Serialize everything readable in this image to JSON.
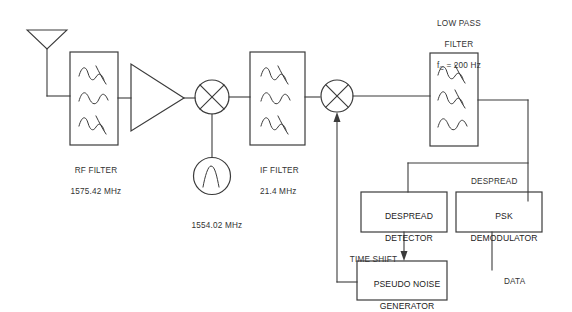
{
  "diagram": {
    "type": "block-diagram",
    "stroke_color": "#3b3b3b",
    "text_color": "#333333",
    "background": "#ffffff"
  },
  "blocks": {
    "rf_filter": {
      "label": "RF FILTER",
      "value": "1575.42 MHz",
      "icon": "bandpass-filter-waves"
    },
    "amplifier": {
      "icon": "amplifier-triangle"
    },
    "mixer1": {
      "icon": "mixer-circle-x"
    },
    "oscillator": {
      "label": "1554.02 MHz",
      "icon": "oscillator-circle-sine"
    },
    "if_filter": {
      "label": "IF FILTER",
      "value": "21.4 MHz",
      "icon": "bandpass-filter-waves"
    },
    "mixer2": {
      "icon": "mixer-circle-x"
    },
    "low_pass_filter": {
      "line1": "LOW PASS",
      "line2": "FILTER",
      "cutoff_prefix": "f",
      "cutoff_sub": "C",
      "cutoff_value": " = 200 Hz",
      "icon": "lowpass-filter-waves"
    },
    "despread_detector": {
      "line1": "DESPREAD",
      "line2": "DETECTOR"
    },
    "psk_demodulator": {
      "line1": "PSK",
      "line2": "DEMODULATOR"
    },
    "pseudo_noise_generator": {
      "line1": "PSEUDO NOISE",
      "line2": "GENERATOR"
    },
    "antenna": {
      "icon": "antenna-dipole"
    }
  },
  "signal_labels": {
    "despread": "DESPREAD",
    "time_shift": "TIME SHIFT",
    "data": "DATA"
  }
}
